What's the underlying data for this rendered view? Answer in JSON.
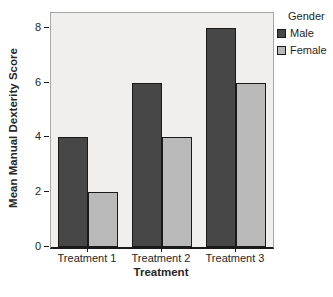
{
  "chart_data": {
    "type": "bar",
    "title": "",
    "xlabel": "Treatment",
    "ylabel": "Mean Manual Dexterity Score",
    "categories": [
      "Treatment 1",
      "Treatment 2",
      "Treatment 3"
    ],
    "series": [
      {
        "name": "Male",
        "values": [
          4,
          6,
          8
        ],
        "color": "#474747"
      },
      {
        "name": "Female",
        "values": [
          2,
          4,
          6
        ],
        "color": "#b9b9b9"
      }
    ],
    "ylim": [
      0,
      8
    ],
    "yticks": [
      0,
      2,
      4,
      6,
      8
    ],
    "grid": "off",
    "legend_title": "Gender",
    "legend_position": "top-right-outside"
  },
  "colors": {
    "plot_background": "#f0efed",
    "plot_border": "#a6a6a6",
    "axis_line": "#1a1a1a",
    "bar_border": "#1a1a1a",
    "text": "#262626"
  }
}
